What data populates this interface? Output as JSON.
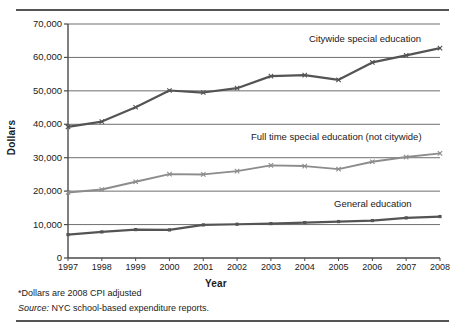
{
  "chart_data": {
    "type": "line",
    "title": "",
    "xlabel": "Year",
    "ylabel": "Dollars",
    "categories": [
      "1997",
      "1998",
      "1999",
      "2000",
      "2001",
      "2002",
      "2003",
      "2004",
      "2005",
      "2006",
      "2007",
      "2008"
    ],
    "ylim": [
      0,
      70000
    ],
    "yticks": [
      0,
      10000,
      20000,
      30000,
      40000,
      50000,
      60000,
      70000
    ],
    "ytick_labels": [
      "0",
      "10,000",
      "20,000",
      "30,000",
      "40,000",
      "50,000",
      "60,000",
      "70,000"
    ],
    "grid": true,
    "legend_position": "inline-above-series",
    "series": [
      {
        "name": "Citywide special education",
        "color": "#545454",
        "values": [
          39200,
          40800,
          45100,
          50100,
          49500,
          50800,
          54400,
          54700,
          53300,
          58500,
          60600,
          62800
        ]
      },
      {
        "name": "Full time special education (not citywide)",
        "color": "#8c8c8c",
        "values": [
          19600,
          20500,
          22800,
          25100,
          25000,
          26000,
          27700,
          27500,
          26600,
          28800,
          30200,
          31300
        ]
      },
      {
        "name": "General education",
        "color": "#545454",
        "values": [
          7000,
          7800,
          8500,
          8400,
          9900,
          10100,
          10300,
          10600,
          10900,
          11200,
          12000,
          12400
        ]
      }
    ],
    "annotations": [
      {
        "id": "citywide-label",
        "text": "Citywide special education"
      },
      {
        "id": "fulltime-label",
        "text": "Full time special education (not citywide)"
      },
      {
        "id": "general-label",
        "text": "General education"
      }
    ]
  },
  "footnotes": {
    "cpi_note": "*Dollars are 2008 CPI adjusted",
    "source_prefix": "Source:",
    "source_text": " NYC school-based expenditure reports."
  },
  "colors": {
    "citywide": "#545454",
    "fulltime": "#8c8c8c",
    "general": "#545454",
    "grid": "#6f6f6f",
    "axis": "#4a4a4a",
    "rule": "#555555",
    "text": "#1a1a1a"
  }
}
